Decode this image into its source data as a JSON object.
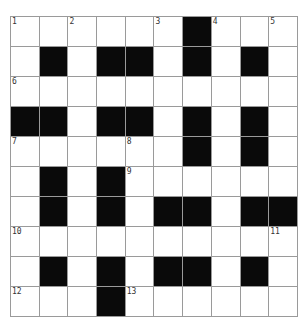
{
  "page_number": "",
  "crossword": {
    "rows": 10,
    "cols": 10,
    "colors": {
      "black": "#0a0a0a",
      "white": "#ffffff",
      "grid_line": "#9a9a9a"
    },
    "grid": [
      [
        "1",
        ".",
        "2",
        ".",
        ".",
        "3",
        "#",
        "4",
        ".",
        "5"
      ],
      [
        ".",
        "#",
        ".",
        "#",
        "#",
        ".",
        "#",
        ".",
        "#",
        "."
      ],
      [
        "6",
        ".",
        ".",
        ".",
        ".",
        ".",
        ".",
        ".",
        ".",
        "."
      ],
      [
        "#",
        "#",
        ".",
        "#",
        "#",
        ".",
        "#",
        ".",
        "#",
        "."
      ],
      [
        "7",
        ".",
        ".",
        ".",
        "8",
        ".",
        "#",
        ".",
        "#",
        "."
      ],
      [
        ".",
        "#",
        ".",
        "#",
        "9",
        ".",
        ".",
        ".",
        ".",
        "."
      ],
      [
        ".",
        "#",
        ".",
        "#",
        ".",
        "#",
        "#",
        ".",
        "#",
        "#"
      ],
      [
        "10",
        ".",
        ".",
        ".",
        ".",
        ".",
        ".",
        ".",
        ".",
        "11"
      ],
      [
        ".",
        "#",
        ".",
        "#",
        ".",
        "#",
        "#",
        ".",
        "#",
        "."
      ],
      [
        "12",
        ".",
        ".",
        "#",
        "13",
        ".",
        ".",
        ".",
        ".",
        "."
      ]
    ]
  }
}
